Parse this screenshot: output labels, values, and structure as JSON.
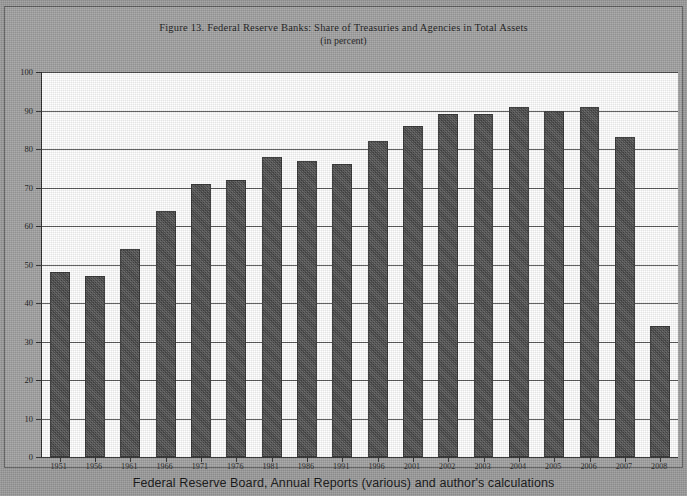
{
  "chart_data": {
    "type": "bar",
    "title": "Figure 13. Federal Reserve Banks: Share of Treasuries and Agencies in Total Assets",
    "subtitle": "(in percent)",
    "xlabel": "",
    "ylabel": "",
    "ylim": [
      0,
      100
    ],
    "ytick_step": 10,
    "yticks": [
      "0",
      "10",
      "20",
      "30",
      "40",
      "50",
      "60",
      "70",
      "80",
      "90",
      "100"
    ],
    "grid": true,
    "legend": "none",
    "categories": [
      "1951",
      "1956",
      "1961",
      "1966",
      "1971",
      "1976",
      "1981",
      "1986",
      "1991",
      "1996",
      "2001",
      "2002",
      "2003",
      "2004",
      "2005",
      "2006",
      "2007",
      "2008"
    ],
    "values": [
      48,
      47,
      54,
      64,
      71,
      72,
      78,
      77,
      76,
      82,
      86,
      89,
      89,
      91,
      90,
      91,
      83,
      34
    ],
    "series": [
      {
        "name": "Share of Treasuries and Agencies in Total Assets",
        "values": [
          48,
          47,
          54,
          64,
          71,
          72,
          78,
          77,
          76,
          82,
          86,
          89,
          89,
          91,
          90,
          91,
          83,
          34
        ],
        "color": "#4b4b4b"
      }
    ],
    "source_note": "Federal Reserve Board, Annual Reports (various) and author's calculations"
  },
  "figure": {
    "plot_background": "#ffffff",
    "page_background": "#9b9b9b",
    "bar_color": "#4b4b4b",
    "axis_color": "#2b2b2b"
  }
}
